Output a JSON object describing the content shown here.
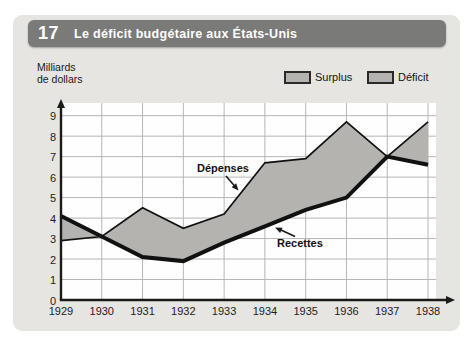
{
  "header": {
    "number": "17",
    "title": "Le déficit budgétaire aux États-Unis",
    "bar_color": "#7a7a78",
    "text_color": "#ffffff"
  },
  "y_axis_label": {
    "line1": "Milliards",
    "line2": "de dollars"
  },
  "legend": {
    "items": [
      {
        "label": "Surplus"
      },
      {
        "label": "Déficit"
      }
    ],
    "swatch_color": "#b4b3b0",
    "swatch_border": "#2a2a2a"
  },
  "annotations": {
    "depenses_label": "Dépenses",
    "recettes_label": "Recettes"
  },
  "chart_data": {
    "type": "area",
    "title": "Le déficit budgétaire aux États-Unis",
    "x": [
      1929,
      1930,
      1931,
      1932,
      1933,
      1934,
      1935,
      1936,
      1937,
      1938
    ],
    "series": [
      {
        "name": "Dépenses",
        "style": "thin-line",
        "values": [
          2.9,
          3.1,
          4.5,
          3.5,
          4.2,
          6.7,
          6.9,
          8.7,
          7.0,
          8.7
        ]
      },
      {
        "name": "Recettes",
        "style": "thick-line",
        "values": [
          4.1,
          3.1,
          2.1,
          1.9,
          2.8,
          3.6,
          4.4,
          5.0,
          7.0,
          6.6
        ]
      }
    ],
    "ylabel": "Milliards de dollars",
    "ylim": [
      0,
      9
    ],
    "yticks": [
      0,
      1,
      2,
      3,
      4,
      5,
      6,
      7,
      8,
      9
    ],
    "legend": [
      "Surplus",
      "Déficit"
    ],
    "legend_position": "top-right",
    "grid": true,
    "fill": "gray area between the two curves (Surplus where Recettes > Dépenses, Déficit where Dépenses > Recettes)"
  },
  "colors": {
    "panel_background": "#e6e5e2",
    "plot_background": "#fefefe",
    "grid": "#b7b6b3",
    "axis": "#1a1a1a",
    "line": "#111111",
    "area_fill": "#b4b3b0"
  }
}
